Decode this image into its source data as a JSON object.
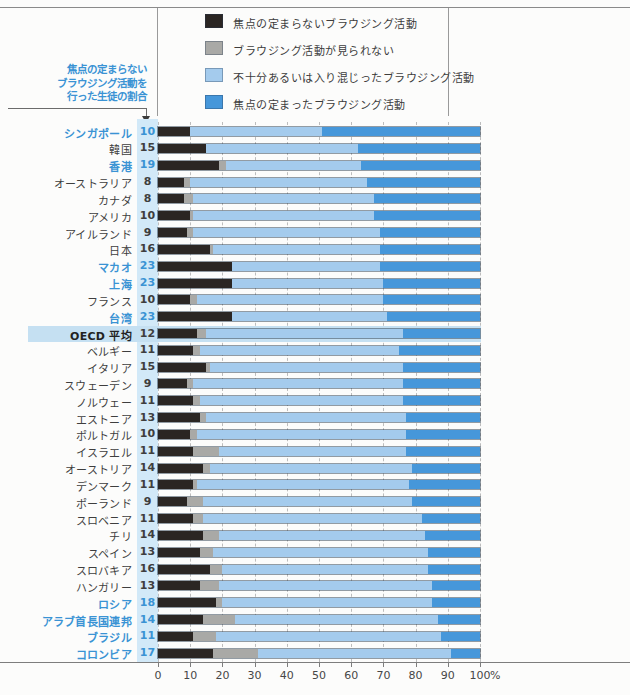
{
  "figure": {
    "annotation": {
      "lines": [
        "焦点の定まらない",
        "ブラウジング活動を",
        "行った生徒の割合"
      ]
    },
    "legend": [
      {
        "key": "unfocused",
        "label": "焦点の定まらないブラウジング活動"
      },
      {
        "key": "none",
        "label": "ブラウジング活動が見られない"
      },
      {
        "key": "mixed",
        "label": "不十分あるいは入り混じったブラウジング活動"
      },
      {
        "key": "focused",
        "label": "焦点の定まったブラウジング活動"
      }
    ],
    "axis": {
      "ticks": [
        0,
        10,
        20,
        30,
        40,
        50,
        60,
        70,
        80,
        90,
        100
      ],
      "unit": "%"
    }
  },
  "colors": {
    "seg_unfocused": "#2b2623",
    "seg_none": "#a9a9a6",
    "seg_mixed": "#a4cbed",
    "seg_focused": "#4697da",
    "accent_text": "#3a93d4",
    "normal_text": "#3e3e3e",
    "value_stripe_bg": "#d2e9f8",
    "highlight_bg": "#c5e0f2"
  },
  "chart_data": {
    "type": "bar",
    "stacked": true,
    "orientation": "horizontal",
    "xlim": [
      0,
      100
    ],
    "grid": true,
    "legend_position": "top",
    "series_names": [
      "焦点の定まらないブラウジング活動",
      "ブラウジング活動が見られない",
      "不十分あるいは入り混じったブラウジング活動",
      "焦点の定まったブラウジング活動"
    ],
    "rows": [
      {
        "label": "シンガポール",
        "shown_value": 10,
        "unfocused": 10,
        "none": 0,
        "mixed": 41,
        "focused": 49,
        "accent": true,
        "highlight": false
      },
      {
        "label": "韓国",
        "shown_value": 15,
        "unfocused": 15,
        "none": 0,
        "mixed": 47,
        "focused": 38,
        "accent": false,
        "highlight": false
      },
      {
        "label": "香港",
        "shown_value": 19,
        "unfocused": 19,
        "none": 2,
        "mixed": 42,
        "focused": 37,
        "accent": true,
        "highlight": false
      },
      {
        "label": "オーストラリア",
        "shown_value": 8,
        "unfocused": 8,
        "none": 2,
        "mixed": 55,
        "focused": 35,
        "accent": false,
        "highlight": false
      },
      {
        "label": "カナダ",
        "shown_value": 8,
        "unfocused": 8,
        "none": 3,
        "mixed": 56,
        "focused": 33,
        "accent": false,
        "highlight": false
      },
      {
        "label": "アメリカ",
        "shown_value": 10,
        "unfocused": 10,
        "none": 1,
        "mixed": 56,
        "focused": 33,
        "accent": false,
        "highlight": false
      },
      {
        "label": "アイルランド",
        "shown_value": 9,
        "unfocused": 9,
        "none": 2,
        "mixed": 58,
        "focused": 31,
        "accent": false,
        "highlight": false
      },
      {
        "label": "日本",
        "shown_value": 16,
        "unfocused": 16,
        "none": 1,
        "mixed": 52,
        "focused": 31,
        "accent": false,
        "highlight": false
      },
      {
        "label": "マカオ",
        "shown_value": 23,
        "unfocused": 23,
        "none": 0,
        "mixed": 46,
        "focused": 31,
        "accent": true,
        "highlight": false
      },
      {
        "label": "上海",
        "shown_value": 23,
        "unfocused": 23,
        "none": 0,
        "mixed": 47,
        "focused": 30,
        "accent": true,
        "highlight": false
      },
      {
        "label": "フランス",
        "shown_value": 10,
        "unfocused": 10,
        "none": 2,
        "mixed": 58,
        "focused": 30,
        "accent": false,
        "highlight": false
      },
      {
        "label": "台湾",
        "shown_value": 23,
        "unfocused": 23,
        "none": 0,
        "mixed": 48,
        "focused": 29,
        "accent": true,
        "highlight": false
      },
      {
        "label": "OECD 平均",
        "shown_value": 12,
        "unfocused": 12,
        "none": 3,
        "mixed": 61,
        "focused": 24,
        "accent": false,
        "highlight": true
      },
      {
        "label": "ベルギー",
        "shown_value": 11,
        "unfocused": 11,
        "none": 2,
        "mixed": 62,
        "focused": 25,
        "accent": false,
        "highlight": false
      },
      {
        "label": "イタリア",
        "shown_value": 15,
        "unfocused": 15,
        "none": 1,
        "mixed": 60,
        "focused": 24,
        "accent": false,
        "highlight": false
      },
      {
        "label": "スウェーデン",
        "shown_value": 9,
        "unfocused": 9,
        "none": 2,
        "mixed": 65,
        "focused": 24,
        "accent": false,
        "highlight": false
      },
      {
        "label": "ノルウェー",
        "shown_value": 11,
        "unfocused": 11,
        "none": 2,
        "mixed": 63,
        "focused": 24,
        "accent": false,
        "highlight": false
      },
      {
        "label": "エストニア",
        "shown_value": 13,
        "unfocused": 13,
        "none": 2,
        "mixed": 62,
        "focused": 23,
        "accent": false,
        "highlight": false
      },
      {
        "label": "ポルトガル",
        "shown_value": 10,
        "unfocused": 10,
        "none": 2,
        "mixed": 65,
        "focused": 23,
        "accent": false,
        "highlight": false
      },
      {
        "label": "イスラエル",
        "shown_value": 11,
        "unfocused": 11,
        "none": 8,
        "mixed": 58,
        "focused": 23,
        "accent": false,
        "highlight": false
      },
      {
        "label": "オーストリア",
        "shown_value": 14,
        "unfocused": 14,
        "none": 2,
        "mixed": 63,
        "focused": 21,
        "accent": false,
        "highlight": false
      },
      {
        "label": "デンマーク",
        "shown_value": 11,
        "unfocused": 11,
        "none": 1,
        "mixed": 66,
        "focused": 22,
        "accent": false,
        "highlight": false
      },
      {
        "label": "ポーランド",
        "shown_value": 9,
        "unfocused": 9,
        "none": 5,
        "mixed": 65,
        "focused": 21,
        "accent": false,
        "highlight": false
      },
      {
        "label": "スロベニア",
        "shown_value": 11,
        "unfocused": 11,
        "none": 3,
        "mixed": 68,
        "focused": 18,
        "accent": false,
        "highlight": false
      },
      {
        "label": "チリ",
        "shown_value": 14,
        "unfocused": 14,
        "none": 5,
        "mixed": 64,
        "focused": 17,
        "accent": false,
        "highlight": false
      },
      {
        "label": "スペイン",
        "shown_value": 13,
        "unfocused": 13,
        "none": 4,
        "mixed": 67,
        "focused": 16,
        "accent": false,
        "highlight": false
      },
      {
        "label": "スロバキア",
        "shown_value": 16,
        "unfocused": 16,
        "none": 4,
        "mixed": 64,
        "focused": 16,
        "accent": false,
        "highlight": false
      },
      {
        "label": "ハンガリー",
        "shown_value": 13,
        "unfocused": 13,
        "none": 6,
        "mixed": 66,
        "focused": 15,
        "accent": false,
        "highlight": false
      },
      {
        "label": "ロシア",
        "shown_value": 18,
        "unfocused": 18,
        "none": 2,
        "mixed": 65,
        "focused": 15,
        "accent": true,
        "highlight": false
      },
      {
        "label": "アラブ首長国連邦",
        "shown_value": 14,
        "unfocused": 14,
        "none": 10,
        "mixed": 63,
        "focused": 13,
        "accent": true,
        "highlight": false
      },
      {
        "label": "ブラジル",
        "shown_value": 11,
        "unfocused": 11,
        "none": 7,
        "mixed": 70,
        "focused": 12,
        "accent": true,
        "highlight": false
      },
      {
        "label": "コロンビア",
        "shown_value": 17,
        "unfocused": 17,
        "none": 14,
        "mixed": 60,
        "focused": 9,
        "accent": true,
        "highlight": false
      }
    ]
  }
}
